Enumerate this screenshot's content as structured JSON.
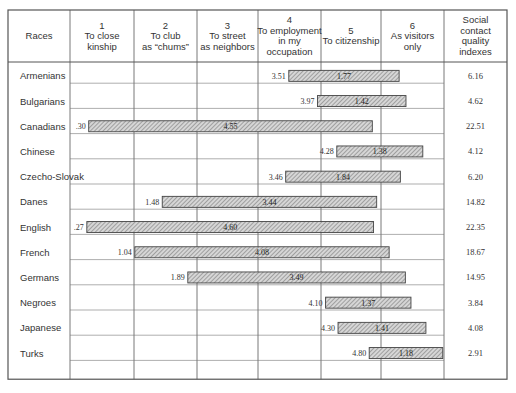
{
  "chart_data": {
    "type": "table",
    "subtype": "range-bar table",
    "title": "",
    "columns": [
      {
        "key": "race",
        "label": [
          "Races"
        ]
      },
      {
        "key": "c1",
        "label": [
          "1",
          "To close",
          "kinship"
        ]
      },
      {
        "key": "c2",
        "label": [
          "2",
          "To club",
          "as “chums”"
        ]
      },
      {
        "key": "c3",
        "label": [
          "3",
          "To street",
          "as neighbors"
        ]
      },
      {
        "key": "c4",
        "label": [
          "4",
          "To employment",
          "in my",
          "occupation"
        ]
      },
      {
        "key": "c5",
        "label": [
          "5",
          "To citizenship"
        ]
      },
      {
        "key": "c6",
        "label": [
          "6",
          "As visitors",
          "only"
        ]
      },
      {
        "key": "index",
        "label": [
          "Social",
          "contact",
          "quality",
          "indexes"
        ]
      }
    ],
    "scale": {
      "min": 0,
      "max": 6
    },
    "rows": [
      {
        "race": "Armenians",
        "start_label": "3.51",
        "start": 3.51,
        "spread_label": "1.77",
        "spread": 1.77,
        "index": "6.16"
      },
      {
        "race": "Bulgarians",
        "start_label": "3.97",
        "start": 3.97,
        "spread_label": "1.42",
        "spread": 1.42,
        "index": "4.62"
      },
      {
        "race": "Canadians",
        "start_label": ".30",
        "start": 0.3,
        "spread_label": "4.55",
        "spread": 4.55,
        "index": "22.51"
      },
      {
        "race": "Chinese",
        "start_label": "4.28",
        "start": 4.28,
        "spread_label": "1.38",
        "spread": 1.38,
        "index": "4.12"
      },
      {
        "race": "Czecho-Slovak",
        "start_label": "3.46",
        "start": 3.46,
        "spread_label": "1.84",
        "spread": 1.84,
        "index": "6.20"
      },
      {
        "race": "Danes",
        "start_label": "1.48",
        "start": 1.48,
        "spread_label": "3.44",
        "spread": 3.44,
        "index": "14.82"
      },
      {
        "race": "English",
        "start_label": ".27",
        "start": 0.27,
        "spread_label": "4.60",
        "spread": 4.6,
        "index": "22.35"
      },
      {
        "race": "French",
        "start_label": "1.04",
        "start": 1.04,
        "spread_label": "4.08",
        "spread": 4.08,
        "index": "18.67"
      },
      {
        "race": "Germans",
        "start_label": "1.89",
        "start": 1.89,
        "spread_label": "3.49",
        "spread": 3.49,
        "index": "14.95"
      },
      {
        "race": "Negroes",
        "start_label": "4.10",
        "start": 4.1,
        "spread_label": "1.37",
        "spread": 1.37,
        "index": "3.84"
      },
      {
        "race": "Japanese",
        "start_label": "4.30",
        "start": 4.3,
        "spread_label": "1.41",
        "spread": 1.41,
        "index": "4.08"
      },
      {
        "race": "Turks",
        "start_label": "4.80",
        "start": 4.8,
        "spread_label": "1.18",
        "spread": 1.18,
        "index": "2.91"
      }
    ],
    "colors": {
      "bar_fill": "#bdbdbd",
      "bar_stroke": "#444444",
      "grid": "#555555"
    }
  }
}
